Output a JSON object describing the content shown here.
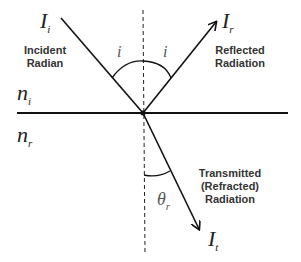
{
  "diagram": {
    "labels": {
      "incident_symbol": "I",
      "incident_sub": "i",
      "incident_text_1": "Incident",
      "incident_text_2": "Radian",
      "reflected_symbol": "I",
      "reflected_sub": "r",
      "reflected_text_1": "Reflected",
      "reflected_text_2": "Radiation",
      "transmitted_symbol": "I",
      "transmitted_sub": "t",
      "transmitted_text_1": "Transmitted",
      "transmitted_text_2": "(Refracted)",
      "transmitted_text_3": "Radiation",
      "n_upper": "n",
      "n_upper_sub": "i",
      "n_lower": "n",
      "n_lower_sub": "r",
      "angle_incident": "i",
      "angle_reflected": "i",
      "angle_refracted": "θ",
      "angle_refracted_sub": "r"
    },
    "colors": {
      "line": "#111111",
      "text": "#333333"
    }
  }
}
